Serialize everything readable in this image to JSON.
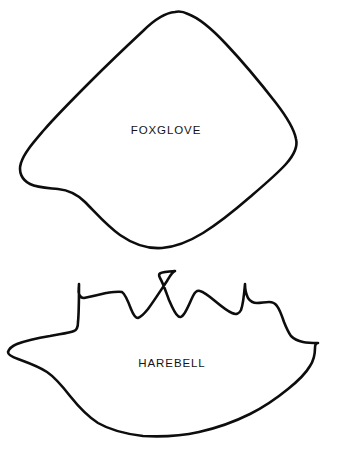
{
  "page": {
    "background_color": "#ffffff",
    "outline_color": "#0d0d0d",
    "text_color": "#141414",
    "width": 338,
    "height": 454,
    "top_cropped_fragment": ""
  },
  "shapes": [
    {
      "id": "foxglove",
      "label": "FOXGLOVE",
      "description": "rounded diamond pattern piece with soft notch on lower left",
      "label_x": 166,
      "label_y": 131,
      "bounds": {
        "x": 14,
        "y": 10,
        "width": 284,
        "height": 240
      },
      "path": "M 175 12 C 163 13 152 22 143 31 C 128 45 108 64 92 80 C 74 98 56 116 44 130 C 33 143 24 153 21 163 C 18 172 22 180 30 184 C 38 188 49 188 58 189 C 68 190 77 194 85 202 C 96 213 107 226 120 235 C 133 244 148 249 162 248 C 176 247 190 241 203 233 C 219 223 235 210 250 197 C 264 185 277 174 286 164 C 294 155 298 147 296 139 C 294 128 286 116 276 103 C 262 85 243 62 226 44 C 212 29 199 18 188 14 C 184 12 179 11 175 12 Z"
    },
    {
      "id": "harebell",
      "label": "HAREBELL",
      "description": "crown or leaf shaped pattern piece with jagged peaks on top and pointed left tail",
      "label_x": 172,
      "label_y": 364,
      "bounds": {
        "x": 6,
        "y": 269,
        "width": 314,
        "height": 168
      },
      "path": "M 175 271 C 172 272 170 276 167 281 C 161 290 154 301 148 309 C 144 314 141 317 138 318 C 135 318 133 314 131 309 C 128 301 125 294 122 292 C 119 291 113 292 106 293 C 98 295 89 297 84 298 C 81 298 80 297 79 294 C 78 291 79 288 79 284 C 79 297 79 312 78 322 C 78 327 77 330 74 331 C 69 333 60 334 50 336 C 38 338 25 341 17 344 C 12 346 9 349 8 352 C 8 355 12 357 18 359 C 26 362 38 366 47 372 C 56 378 63 387 70 396 C 78 406 87 416 98 423 C 110 430 126 434 143 436 C 161 437 181 436 199 432 C 217 428 234 422 250 414 C 264 407 277 398 288 389 C 298 381 306 373 310 366 C 314 360 315 354 315 348 C 315 345 316 343 318 343 C 314 343 308 343 303 342 C 298 341 294 339 291 336 C 288 332 286 327 284 322 C 282 316 280 310 277 306 C 275 303 272 302 269 302 C 265 302 261 303 257 303 C 253 303 250 301 248 298 C 246 294 245 289 245 284 C 244 296 243 305 241 310 C 239 314 236 315 232 313 C 227 311 221 306 215 301 C 209 296 204 292 200 291 C 197 290 195 292 193 296 C 190 302 187 310 184 314 C 182 317 180 318 178 316 C 175 314 172 307 169 300 C 166 292 163 283 160 278 C 158 274 157 272 175 271 Z"
    }
  ]
}
